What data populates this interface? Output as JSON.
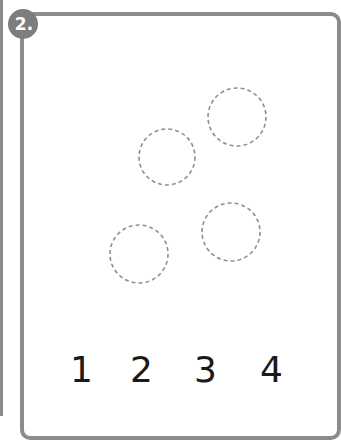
{
  "exercise": {
    "number_label": "2.",
    "badge_color": "#7d7d7d",
    "border_color": "#8c8c8c"
  },
  "circles": [
    {
      "cx": 237,
      "cy": 117,
      "r": 29
    },
    {
      "cx": 167,
      "cy": 157,
      "r": 28
    },
    {
      "cx": 231,
      "cy": 232,
      "r": 29
    },
    {
      "cx": 139,
      "cy": 254,
      "r": 29
    }
  ],
  "answer_options": [
    {
      "label": "1",
      "x": 70
    },
    {
      "label": "2",
      "x": 130
    },
    {
      "label": "3",
      "x": 194
    },
    {
      "label": "4",
      "x": 260
    }
  ]
}
